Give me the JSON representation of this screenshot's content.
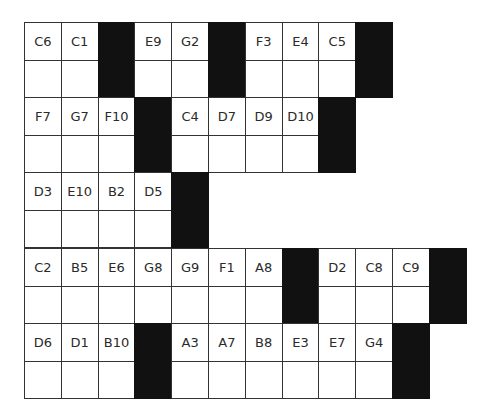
{
  "rows": [
    {
      "top": 22,
      "cells": [
        "C6",
        "C1",
        "#",
        "E9",
        "G2",
        "#",
        "F3",
        "E4",
        "C5",
        "#"
      ]
    },
    {
      "top": 97,
      "cells": [
        "F7",
        "G7",
        "F10",
        "#",
        "C4",
        "D7",
        "D9",
        "D10",
        "#"
      ]
    },
    {
      "top": 172,
      "cells": [
        "D3",
        "E10",
        "B2",
        "D5",
        "#"
      ]
    },
    {
      "top": 248,
      "cells": [
        "C2",
        "B5",
        "E6",
        "G8",
        "G9",
        "F1",
        "A8",
        "#",
        "D2",
        "C8",
        "C9",
        "#"
      ]
    },
    {
      "top": 323,
      "cells": [
        "D6",
        "D1",
        "B10",
        "#",
        "A3",
        "A7",
        "B8",
        "E3",
        "E7",
        "G4",
        "#"
      ]
    }
  ],
  "colors": {
    "block": "#111111",
    "border": "#333333",
    "text": "#2a2a2a"
  }
}
